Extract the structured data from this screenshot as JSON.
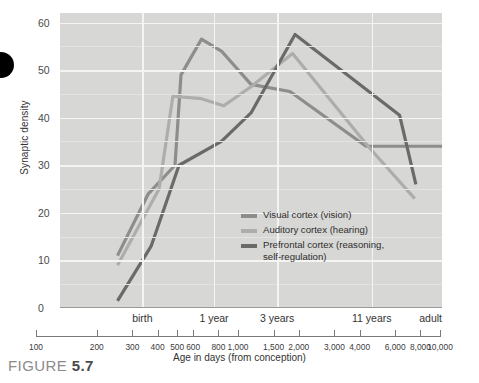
{
  "figure": {
    "caption_prefix": "FIGURE ",
    "caption_number": "5.7"
  },
  "axes": {
    "y_label": "Synaptic density",
    "y_ticks": [
      "60",
      "50",
      "40",
      "30",
      "20",
      "10",
      "0"
    ],
    "x_label": "Age in days (from conception)",
    "x_categories": [
      "birth",
      "1 year",
      "3 years",
      "11 years",
      "adult"
    ],
    "x_scale_ticks": [
      "100",
      "200",
      "300",
      "400",
      "500",
      "600",
      "800",
      "1,000",
      "1,500",
      "2,000",
      "3,000",
      "4,000",
      "6,000",
      "8,000",
      "10,000"
    ]
  },
  "legend": {
    "items": [
      {
        "label": "Visual cortex (vision)",
        "color": "#8d8d8b"
      },
      {
        "label": "Auditory cortex (hearing)",
        "color": "#adadab"
      },
      {
        "label": "Prefrontal cortex (reasoning,\nself-regulation)",
        "color": "#6a6a68"
      }
    ]
  },
  "colors": {
    "plot_background": "#d7d7d5",
    "gridline": "#f4f4f2",
    "visual": "#8d8d8b",
    "auditory": "#adadab",
    "prefrontal": "#6a6a68"
  },
  "chart_data": {
    "type": "line",
    "title": "",
    "xlabel": "Age in days (from conception)",
    "ylabel": "Synaptic density",
    "xscale": "log",
    "xlim": [
      100,
      10000
    ],
    "ylim": [
      0,
      62
    ],
    "grid": true,
    "legend_position": "inside-center",
    "x_category_markers": [
      {
        "label": "birth",
        "days": 270
      },
      {
        "label": "1 year",
        "days": 640
      },
      {
        "label": "3 years",
        "days": 1370
      },
      {
        "label": "11 years",
        "days": 4290
      },
      {
        "label": "adult",
        "days": 10000
      }
    ],
    "series": [
      {
        "name": "Visual cortex (vision)",
        "color": "#8d8d8b",
        "points": [
          {
            "x": 200,
            "y": 11
          },
          {
            "x": 290,
            "y": 24
          },
          {
            "x": 400,
            "y": 30
          },
          {
            "x": 430,
            "y": 49
          },
          {
            "x": 550,
            "y": 56.5
          },
          {
            "x": 700,
            "y": 54
          },
          {
            "x": 1000,
            "y": 47
          },
          {
            "x": 1600,
            "y": 45.5
          },
          {
            "x": 4000,
            "y": 34
          },
          {
            "x": 10000,
            "y": 34
          }
        ]
      },
      {
        "name": "Auditory cortex (hearing)",
        "color": "#adadab",
        "points": [
          {
            "x": 200,
            "y": 9
          },
          {
            "x": 330,
            "y": 25
          },
          {
            "x": 390,
            "y": 44.5
          },
          {
            "x": 550,
            "y": 44
          },
          {
            "x": 720,
            "y": 42.5
          },
          {
            "x": 1000,
            "y": 46.5
          },
          {
            "x": 1650,
            "y": 53.5
          },
          {
            "x": 4100,
            "y": 34
          },
          {
            "x": 7200,
            "y": 23
          }
        ]
      },
      {
        "name": "Prefrontal cortex (reasoning, self-regulation)",
        "color": "#6a6a68",
        "points": [
          {
            "x": 200,
            "y": 1.5
          },
          {
            "x": 300,
            "y": 13
          },
          {
            "x": 420,
            "y": 30
          },
          {
            "x": 700,
            "y": 35
          },
          {
            "x": 1000,
            "y": 41
          },
          {
            "x": 1700,
            "y": 57.5
          },
          {
            "x": 6000,
            "y": 40.5
          },
          {
            "x": 7300,
            "y": 26
          }
        ]
      }
    ]
  }
}
